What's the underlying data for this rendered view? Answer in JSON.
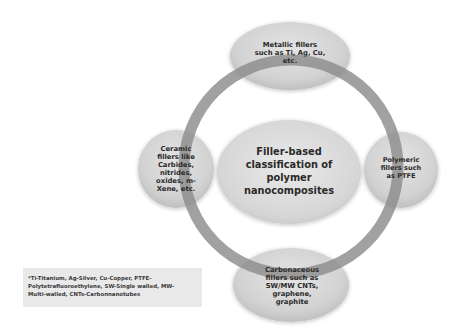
{
  "diagram": {
    "type": "radial-classification",
    "center": {
      "label": "Filler-based\nclassification of\npolymer\nnanocomposites"
    },
    "nodes": [
      {
        "id": "metallic",
        "position": "top",
        "label": "Metallic fillers\nsuch as Ti, Ag, Cu,\netc."
      },
      {
        "id": "polymeric",
        "position": "right",
        "label": "Polymeric\nfillers such\nas PTFE"
      },
      {
        "id": "carbonaceous",
        "position": "bottom",
        "label": "Carbonaceous\nfillers such as\nSW/MW CNTs,\ngraphene,\ngraphite"
      },
      {
        "id": "ceramic",
        "position": "left",
        "label": "Ceramic\nfillers like\nCarbides,\nnitrides,\noxides, m-\nXene, etc."
      }
    ],
    "footnote": "*Ti-Titanium, Ag-Silver, Cu-Copper, PTFE-\nPolytetrafluoroethylene, SW-Single walled, MW-\nMulti-walled, CNTs-Carbonnanotubes",
    "colors": {
      "ring": "#8c8c8c",
      "node_fill_light": "#e2e2e2",
      "node_fill_dark": "#c2c2c2",
      "center_fill_light": "#e6e6e6",
      "center_fill_dark": "#cbcbcb",
      "text": "#2a2a2a",
      "footnote_bg": "#e9e9e9"
    }
  }
}
